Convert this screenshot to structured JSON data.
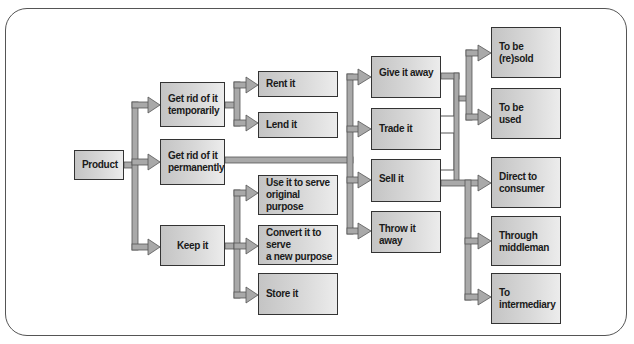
{
  "diagram": {
    "title": "",
    "nodes": {
      "product": {
        "label": "Product"
      },
      "temporarily": {
        "label": "Get rid of it\ntemporarily"
      },
      "permanently": {
        "label": "Get rid of it\npermanently"
      },
      "keep": {
        "label": "Keep it"
      },
      "rent": {
        "label": "Rent it"
      },
      "lend": {
        "label": "Lend it"
      },
      "original": {
        "label": "Use it to serve\noriginal purpose"
      },
      "convert": {
        "label": "Convert it to serve\na new purpose"
      },
      "store": {
        "label": "Store it"
      },
      "give": {
        "label": "Give it away"
      },
      "trade": {
        "label": "Trade it"
      },
      "sell": {
        "label": "Sell it"
      },
      "throw": {
        "label": "Throw it away"
      },
      "resold": {
        "label": "To be\n(re)sold"
      },
      "used": {
        "label": "To be\nused"
      },
      "direct": {
        "label": "Direct to\nconsumer"
      },
      "middleman": {
        "label": "Through\nmiddleman"
      },
      "intermediary": {
        "label": "To\nintermediary"
      }
    },
    "edges": [
      [
        "product",
        "temporarily"
      ],
      [
        "product",
        "permanently"
      ],
      [
        "product",
        "keep"
      ],
      [
        "temporarily",
        "rent"
      ],
      [
        "temporarily",
        "lend"
      ],
      [
        "keep",
        "original"
      ],
      [
        "keep",
        "convert"
      ],
      [
        "keep",
        "store"
      ],
      [
        "permanently",
        "give"
      ],
      [
        "permanently",
        "trade"
      ],
      [
        "permanently",
        "sell"
      ],
      [
        "permanently",
        "throw"
      ],
      [
        "give",
        "resold"
      ],
      [
        "give",
        "used"
      ],
      [
        "trade",
        "resold"
      ],
      [
        "trade",
        "used"
      ],
      [
        "sell",
        "resold"
      ],
      [
        "sell",
        "used"
      ],
      [
        "sell",
        "direct"
      ],
      [
        "sell",
        "middleman"
      ],
      [
        "sell",
        "intermediary"
      ]
    ],
    "colors": {
      "node_fill_dark": "#c4c4c4",
      "node_fill_light": "#ececec",
      "node_border": "#333333",
      "connector_fill": "#a9a9a9",
      "connector_stroke": "#555555",
      "frame_border": "#555555"
    }
  }
}
